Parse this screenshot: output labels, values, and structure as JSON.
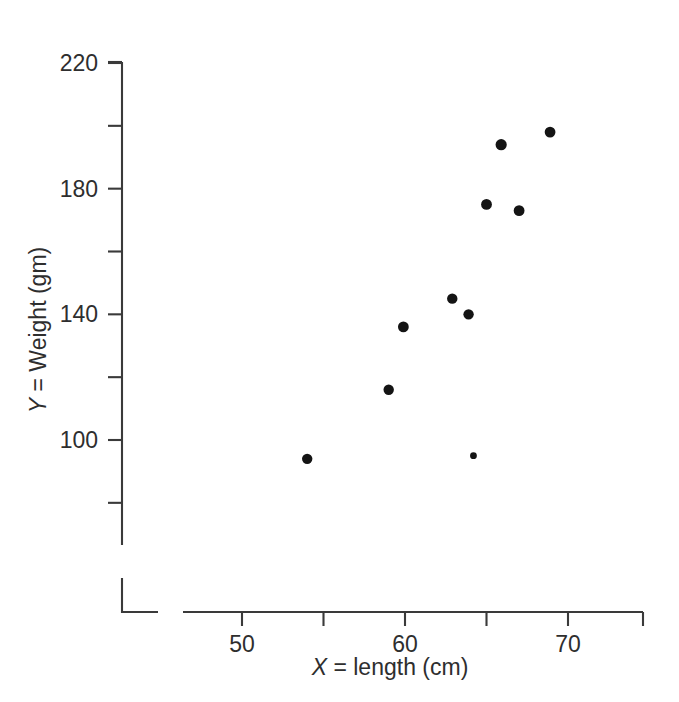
{
  "chart_data": {
    "type": "scatter",
    "title": "",
    "xlabel": "X = length (cm)",
    "xlabel_var": "X",
    "xlabel_rest": " = length (cm)",
    "ylabel": "Y = Weight (gm)",
    "ylabel_var": "Y",
    "ylabel_rest": " = Weight (gm)",
    "xlim": [
      46,
      74.6
    ],
    "ylim": [
      80,
      226
    ],
    "grid": false,
    "legend": null,
    "x_major_ticks": [
      50,
      60,
      70
    ],
    "x_minor_ticks": [
      55,
      65
    ],
    "x_tick_labels": [
      "50",
      "60",
      "70"
    ],
    "y_major_ticks": [
      220,
      180,
      140,
      100
    ],
    "y_minor_ticks": [
      200,
      160,
      120
    ],
    "y_tick_labels": [
      "220",
      "180",
      "140",
      "100"
    ],
    "axis_break": true,
    "marker_color": "#141414",
    "axis_color": "#3a3a3a",
    "points": [
      {
        "x": 54.0,
        "y": 94,
        "r": 5.2
      },
      {
        "x": 59.0,
        "y": 116,
        "r": 5.2
      },
      {
        "x": 59.9,
        "y": 136,
        "r": 5.4
      },
      {
        "x": 62.9,
        "y": 145,
        "r": 5.2
      },
      {
        "x": 63.9,
        "y": 140,
        "r": 5.2
      },
      {
        "x": 64.2,
        "y": 95,
        "r": 3.4
      },
      {
        "x": 65.0,
        "y": 175,
        "r": 5.4
      },
      {
        "x": 65.9,
        "y": 194,
        "r": 5.6
      },
      {
        "x": 67.0,
        "y": 173,
        "r": 5.4
      },
      {
        "x": 68.9,
        "y": 198,
        "r": 5.4
      }
    ]
  },
  "figure": {
    "caption": ""
  }
}
